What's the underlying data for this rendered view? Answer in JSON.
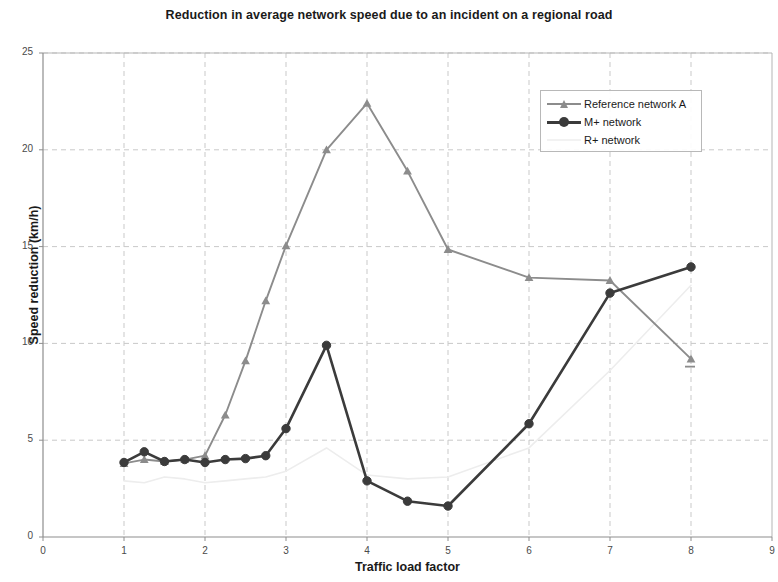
{
  "chart_data": {
    "type": "line",
    "title": "Reduction in average network speed due to an incident on a regional road",
    "xlabel": "Traffic load factor",
    "ylabel": "Speed reduction (km/h)",
    "xlim": [
      0,
      9
    ],
    "ylim": [
      0,
      25
    ],
    "xticks": [
      "0",
      "1",
      "2",
      "3",
      "4",
      "5",
      "6",
      "7",
      "8",
      "9"
    ],
    "yticks": [
      "0",
      "5",
      "10",
      "15",
      "20",
      "25"
    ],
    "grid": true,
    "legend_position": "upper right",
    "series": [
      {
        "name": "Reference network A",
        "color": "#8c8c8c",
        "marker": "triangle",
        "x": [
          1,
          1.25,
          1.5,
          1.75,
          2,
          2.25,
          2.5,
          2.75,
          3,
          3.5,
          4,
          4.5,
          5,
          6,
          7,
          8
        ],
        "values": [
          3.8,
          4.0,
          3.9,
          4.0,
          4.2,
          6.3,
          9.1,
          12.2,
          15.05,
          20.0,
          22.4,
          18.9,
          14.85,
          13.4,
          13.25,
          9.2
        ]
      },
      {
        "name": "M+ network",
        "color": "#3b3b3b",
        "marker": "circle",
        "x": [
          1,
          1.25,
          1.5,
          1.75,
          2,
          2.25,
          2.5,
          2.75,
          3,
          3.5,
          4,
          4.5,
          5,
          6,
          7,
          8
        ],
        "values": [
          3.85,
          4.4,
          3.9,
          4.0,
          3.85,
          4.0,
          4.05,
          4.2,
          5.6,
          9.9,
          2.9,
          1.85,
          1.6,
          5.85,
          12.6,
          13.95
        ]
      },
      {
        "name": "R+ network",
        "color": "#ededed",
        "marker": "none",
        "x": [
          1,
          1.25,
          1.5,
          1.75,
          2,
          2.25,
          2.5,
          2.75,
          3,
          3.5,
          4,
          4.5,
          5,
          6,
          7,
          8
        ],
        "values": [
          2.9,
          2.8,
          3.1,
          3.0,
          2.8,
          2.9,
          3.0,
          3.1,
          3.4,
          4.6,
          3.2,
          3.0,
          3.1,
          4.6,
          8.6,
          13.0
        ]
      }
    ],
    "annotations": [
      {
        "name": "reference-a-tail-dash",
        "x": 8.0,
        "y": 8.8
      }
    ]
  }
}
